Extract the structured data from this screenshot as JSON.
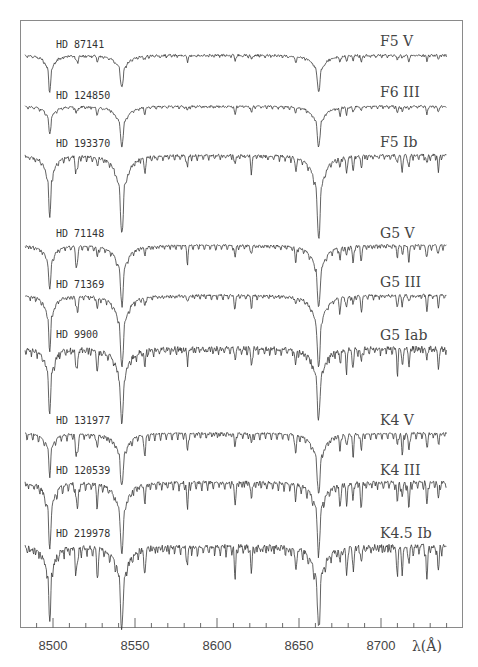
{
  "chart_data": {
    "type": "line",
    "title": "",
    "xlabel": "λ(Å)",
    "ylabel": "",
    "xlim": [
      8480,
      8750
    ],
    "x_ticks_major": [
      8500,
      8550,
      8600,
      8650,
      8700
    ],
    "x_tick_labels": [
      "8500",
      "8550",
      "8600",
      "8650",
      "8700"
    ],
    "x_ticks_minor_step": 10,
    "grid": false,
    "legend": "none; each spectrum labeled with star name (left) and spectral type (right)",
    "ca_ii_triplet_lines": [
      8498,
      8542,
      8662
    ],
    "series": [
      {
        "name": "HD 87141",
        "spectral_type": "F5 V",
        "offset_y": 55,
        "ca_depths": [
          36,
          32,
          36
        ],
        "metal_depth": 6,
        "noise": 2.0
      },
      {
        "name": "HD 124850",
        "spectral_type": "F6 III",
        "offset_y": 106,
        "ca_depths": [
          28,
          40,
          40
        ],
        "metal_depth": 7,
        "noise": 1.5
      },
      {
        "name": "HD 193370",
        "spectral_type": "F5 Ib",
        "offset_y": 155,
        "ca_depths": [
          62,
          78,
          82
        ],
        "metal_depth": 14,
        "noise": 2.5
      },
      {
        "name": "HD 71148",
        "spectral_type": "G5 V",
        "offset_y": 245,
        "ca_depths": [
          44,
          58,
          62
        ],
        "metal_depth": 14,
        "noise": 1.5
      },
      {
        "name": "HD 71369",
        "spectral_type": "G5 III",
        "offset_y": 295,
        "ca_depths": [
          55,
          72,
          72
        ],
        "metal_depth": 12,
        "noise": 2.0
      },
      {
        "name": "HD 9900",
        "spectral_type": "G5 Iab",
        "offset_y": 348,
        "ca_depths": [
          65,
          75,
          70
        ],
        "metal_depth": 18,
        "noise": 4.5
      },
      {
        "name": "HD 131977",
        "spectral_type": "K4 V",
        "offset_y": 433,
        "ca_depths": [
          38,
          52,
          60
        ],
        "metal_depth": 18,
        "noise": 1.8
      },
      {
        "name": "HD 120539",
        "spectral_type": "K4 III",
        "offset_y": 482,
        "ca_depths": [
          66,
          70,
          68
        ],
        "metal_depth": 22,
        "noise": 3.0
      },
      {
        "name": "HD 219978",
        "spectral_type": "K4.5 Ib",
        "offset_y": 546,
        "ca_depths": [
          72,
          78,
          78
        ],
        "metal_depth": 26,
        "noise": 4.5
      }
    ],
    "metal_lines": [
      8514,
      8515,
      8527,
      8556,
      8582,
      8611,
      8621,
      8648,
      8675,
      8679,
      8683,
      8688,
      8710,
      8713,
      8717,
      8728,
      8735
    ]
  },
  "axis": {
    "xlabel": "λ(Å)",
    "ticks": [
      "8500",
      "8550",
      "8600",
      "8650",
      "8700"
    ]
  },
  "labels": {
    "stars": [
      "HD 87141",
      "HD 124850",
      "HD 193370",
      "HD 71148",
      "HD 71369",
      "HD 9900",
      "HD 131977",
      "HD 120539",
      "HD 219978"
    ],
    "types": [
      "F5 V",
      "F6 III",
      "F5 Ib",
      "G5 V",
      "G5 III",
      "G5 Iab",
      "K4 V",
      "K4 III",
      "K4.5 Ib"
    ]
  }
}
